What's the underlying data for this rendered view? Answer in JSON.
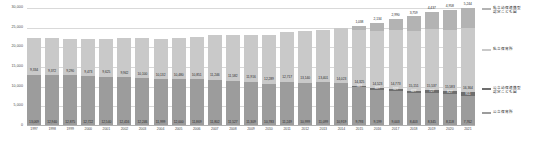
{
  "chart_data": {
    "type": "bar",
    "subtype": "stacked-column",
    "title": "",
    "xlabel": "",
    "ylabel": "",
    "ylim": [
      0,
      30000
    ],
    "yticks": [
      "0",
      "5,000",
      "10,000",
      "15,000",
      "20,000",
      "25,000",
      "30,000"
    ],
    "ytick_values": [
      0,
      5000,
      10000,
      15000,
      20000,
      25000,
      30000
    ],
    "grid": true,
    "legend_position": "right",
    "categories": [
      "1997",
      "1998",
      "1999",
      "2000",
      "2001",
      "2002",
      "2003",
      "2004",
      "2005",
      "2006",
      "2007",
      "2008",
      "2009",
      "2010",
      "2011",
      "2012",
      "2013",
      "2014",
      "2015",
      "2016",
      "2017",
      "2018",
      "2019",
      "2020",
      "2021"
    ],
    "series": [
      {
        "name": "公立保育所",
        "key": "public_nursery",
        "color": "#9c9c9c",
        "values": [
          13069,
          12940,
          12875,
          12722,
          12540,
          12416,
          12246,
          11999,
          12000,
          11869,
          11802,
          11527,
          11309,
          10783,
          11249,
          10999,
          11099,
          10919,
          9793,
          9199,
          9003,
          8403,
          8345,
          8118,
          7762
        ],
        "labels": [
          "13,069",
          "12,940",
          "12,875",
          "12,722",
          "12,540",
          "12,416",
          "12,246",
          "11,999",
          "12,000",
          "11,869",
          "11,802",
          "11,527",
          "11,309",
          "10,783",
          "11,249",
          "10,999",
          "11,099",
          "10,919",
          "9,793",
          "9,199",
          "9,003",
          "8,403",
          "8,345",
          "8,118",
          "7,762"
        ]
      },
      {
        "name": "公立幼保連携型認定こども園",
        "key": "public_cert",
        "color": "#6e6e6e",
        "values": [
          0,
          0,
          0,
          0,
          0,
          0,
          0,
          0,
          0,
          0,
          0,
          0,
          0,
          0,
          0,
          0,
          0,
          0,
          327,
          427,
          527,
          627,
          727,
          827,
          911
        ],
        "labels": [
          "",
          "",
          "",
          "",
          "",
          "",
          "",
          "",
          "",
          "",
          "",
          "",
          "",
          "",
          "",
          "",
          "",
          "",
          "327",
          "427",
          "527",
          "627",
          "727",
          "827",
          "911"
        ]
      },
      {
        "name": "私立保育所",
        "key": "private_nursery",
        "color": "#c9c9c9",
        "values": [
          9334,
          9372,
          9290,
          9473,
          9625,
          9942,
          10100,
          10132,
          10480,
          10851,
          11246,
          11582,
          11916,
          12289,
          12717,
          13140,
          13401,
          14023,
          14325,
          14523,
          14773,
          15151,
          15537,
          15583,
          16364
        ],
        "labels": [
          "9,334",
          "9,372",
          "9,290",
          "9,473",
          "9,625",
          "9,942",
          "10,100",
          "10,132",
          "10,480",
          "10,851",
          "11,246",
          "11,582",
          "11,916",
          "12,289",
          "12,717",
          "13,140",
          "13,401",
          "14,023",
          "14,325",
          "14,523",
          "14,773",
          "15,151",
          "15,537",
          "15,583",
          "16,364"
        ]
      },
      {
        "name": "私立幼保連携型認定こども園",
        "key": "private_cert",
        "color": "#b3b3b3",
        "values": [
          0,
          0,
          0,
          0,
          0,
          0,
          0,
          0,
          0,
          0,
          0,
          0,
          0,
          0,
          0,
          0,
          0,
          0,
          1038,
          2134,
          2990,
          3759,
          4437,
          4958,
          5244
        ],
        "labels": [
          "",
          "",
          "",
          "",
          "",
          "",
          "",
          "",
          "",
          "",
          "",
          "",
          "",
          "",
          "",
          "",
          "",
          "",
          "1,038",
          "2,134",
          "2,990",
          "3,759",
          "4,437",
          "4,958",
          "5,244"
        ]
      }
    ],
    "legend": [
      {
        "label": "私立幼保連携型\n認定こども園",
        "color": "#b3b3b3"
      },
      {
        "label": "私立保育所",
        "color": "#c9c9c9"
      },
      {
        "label": "公立幼保連携型\n認定こども園",
        "color": "#6e6e6e"
      },
      {
        "label": "公立保育所",
        "color": "#9c9c9c"
      }
    ]
  },
  "legend": {
    "private_cert_line1": "私立幼保連携型",
    "private_cert_line2": "認定こども園",
    "private_nursery": "私立保育所",
    "public_cert_line1": "公立幼保連携型",
    "public_cert_line2": "認定こども園",
    "public_nursery": "公立保育所"
  }
}
